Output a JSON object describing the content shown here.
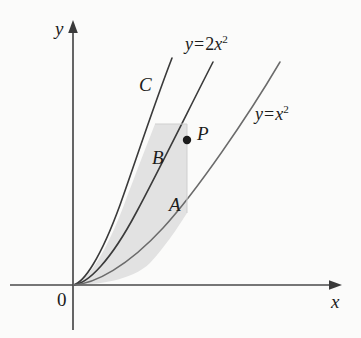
{
  "figure": {
    "type": "math-diagram",
    "background_color": "#fbfbfa"
  },
  "axes": {
    "y_label": "y",
    "x_label": "x",
    "origin_label": "0",
    "axis_color": "#4a4a4a",
    "origin_px": {
      "x": 73,
      "y": 285
    },
    "x_axis_end_px": {
      "x": 341,
      "y": 285
    },
    "y_axis_top_px": {
      "x": 73,
      "y": 22
    },
    "y_axis_bottom_px": {
      "x": 73,
      "y": 330
    },
    "x_axis_start_px": {
      "x": 10,
      "y": 285
    }
  },
  "curves": [
    {
      "name": "curve-c",
      "label": "C",
      "label_px": {
        "x": 139,
        "y": 75
      },
      "coefficient": 8.6,
      "x_end_px": 172,
      "color": "#3a3a3a",
      "stroke_width": 1.5
    },
    {
      "name": "curve-2x2",
      "label": "y = 2x²",
      "equation": {
        "lhs": "y",
        "operator": "=",
        "coefficient": "2",
        "variable": "x",
        "exponent": "2"
      },
      "label_px": {
        "x": 185,
        "y": 34
      },
      "coefficient": 4.6,
      "x_end_px": 213,
      "color": "#3a3a3a",
      "stroke_width": 1.5
    },
    {
      "name": "curve-x2",
      "label": "y = x²",
      "equation": {
        "lhs": "y",
        "operator": "=",
        "coefficient": "",
        "variable": "x",
        "exponent": "2"
      },
      "label_px": {
        "x": 255,
        "y": 104
      },
      "coefficient": 2.3,
      "x_end_px": 280,
      "color": "#6b6b6b",
      "stroke_width": 1.4
    }
  ],
  "point": {
    "name": "point-p",
    "label": "P",
    "label_px": {
      "x": 197,
      "y": 124
    },
    "marker_px": {
      "x": 187,
      "y": 140
    },
    "on_curve": "curve-2x2",
    "radius": 4,
    "color": "#1b1b1b"
  },
  "regions": [
    {
      "name": "region-b",
      "label": "B",
      "label_px": {
        "x": 152,
        "y": 148
      },
      "description": "between curve C and y = 2x squared, left of the vertical through P"
    },
    {
      "name": "region-a",
      "label": "A",
      "label_px": {
        "x": 169,
        "y": 195
      },
      "description": "between y = 2x squared and y = x squared, left of the vertical through P"
    }
  ],
  "shading": {
    "fill_color": "#e2e2e2",
    "edge_color": "#c8c8c8"
  }
}
